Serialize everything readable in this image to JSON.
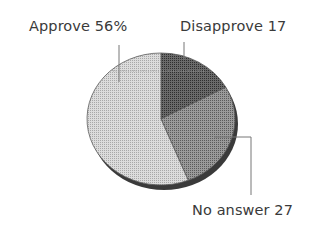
{
  "chart_data": {
    "type": "pie",
    "title": "",
    "slices": [
      {
        "label": "Disapprove",
        "value": 17,
        "display": "Disapprove 17",
        "color": "#555555"
      },
      {
        "label": "No answer",
        "value": 27,
        "display": "No answer 27",
        "color": "#8a8a8a"
      },
      {
        "label": "Approve",
        "value": 56,
        "display": "Approve 56%",
        "color": "#d4d4d4"
      }
    ],
    "start_angle": "12 o'clock",
    "direction": "clockwise",
    "style": "3D tilted pie with drop shadow, dotted halftone fill",
    "legend": "none (callout labels with leader lines)"
  },
  "labels": {
    "approve": "Approve 56%",
    "disapprove": "Disapprove 17",
    "no_answer": "No answer 27"
  }
}
